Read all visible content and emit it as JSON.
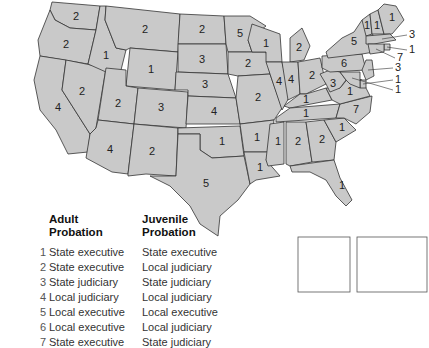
{
  "map": {
    "fill_color": "#c9c9c9",
    "border_color": "#333333",
    "states": [
      {
        "id": "WA",
        "label": "2"
      },
      {
        "id": "OR",
        "label": "2"
      },
      {
        "id": "CA",
        "label": "4"
      },
      {
        "id": "NV",
        "label": "2"
      },
      {
        "id": "ID",
        "label": "1"
      },
      {
        "id": "MT",
        "label": "2"
      },
      {
        "id": "WY",
        "label": "1"
      },
      {
        "id": "UT",
        "label": "2"
      },
      {
        "id": "AZ",
        "label": "4"
      },
      {
        "id": "CO",
        "label": "3"
      },
      {
        "id": "NM",
        "label": "2"
      },
      {
        "id": "ND",
        "label": "2"
      },
      {
        "id": "SD",
        "label": "3"
      },
      {
        "id": "NE",
        "label": "3"
      },
      {
        "id": "KS",
        "label": "4"
      },
      {
        "id": "OK",
        "label": "1"
      },
      {
        "id": "TX",
        "label": "5"
      },
      {
        "id": "MN",
        "label": "5"
      },
      {
        "id": "IA",
        "label": "2"
      },
      {
        "id": "MO",
        "label": "2"
      },
      {
        "id": "AR",
        "label": "1"
      },
      {
        "id": "LA",
        "label": "1"
      },
      {
        "id": "WI",
        "label": "1"
      },
      {
        "id": "IL",
        "label": "4"
      },
      {
        "id": "MI",
        "label": "2"
      },
      {
        "id": "IN",
        "label": "4"
      },
      {
        "id": "OH",
        "label": "2"
      },
      {
        "id": "KY",
        "label": "1"
      },
      {
        "id": "TN",
        "label": "1"
      },
      {
        "id": "MS",
        "label": "1"
      },
      {
        "id": "AL",
        "label": "2"
      },
      {
        "id": "GA",
        "label": "2"
      },
      {
        "id": "FL",
        "label": "1"
      },
      {
        "id": "SC",
        "label": "1"
      },
      {
        "id": "NC",
        "label": "7"
      },
      {
        "id": "VA",
        "label": "1"
      },
      {
        "id": "WV",
        "label": "3"
      },
      {
        "id": "PA",
        "label": "6"
      },
      {
        "id": "NY",
        "label": "5"
      },
      {
        "id": "VT",
        "label": "1"
      },
      {
        "id": "NH",
        "label": "1"
      },
      {
        "id": "ME",
        "label": "1"
      },
      {
        "id": "MA",
        "label": "3"
      },
      {
        "id": "RI",
        "label": "1"
      },
      {
        "id": "CT",
        "label": "7"
      },
      {
        "id": "NJ",
        "label": "3"
      },
      {
        "id": "DE",
        "label": "1"
      },
      {
        "id": "MD",
        "label": "1"
      },
      {
        "id": "HI",
        "label": "3"
      },
      {
        "id": "AK",
        "label": "1"
      }
    ]
  },
  "legend": {
    "adult_header": [
      "Adult",
      "Probation"
    ],
    "juvenile_header": [
      "Juvenile",
      "Probation"
    ],
    "rows": [
      {
        "num": "1",
        "adult": "State executive",
        "juvenile": "State executive"
      },
      {
        "num": "2",
        "adult": "State executive",
        "juvenile": "Local judiciary"
      },
      {
        "num": "3",
        "adult": "State judiciary",
        "juvenile": "State judiciary"
      },
      {
        "num": "4",
        "adult": "Local judiciary",
        "juvenile": "Local judiciary"
      },
      {
        "num": "5",
        "adult": "Local executive",
        "juvenile": "Local executive"
      },
      {
        "num": "6",
        "adult": "Local executive",
        "juvenile": "Local judiciary"
      },
      {
        "num": "7",
        "adult": "State executive",
        "juvenile": "State judiciary"
      }
    ]
  }
}
